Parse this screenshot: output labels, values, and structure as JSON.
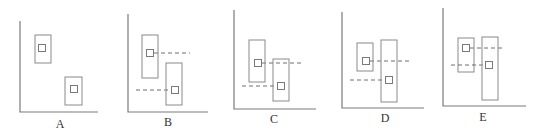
{
  "figure": {
    "colors": {
      "axis": "#7a7a7a",
      "box": "#8a8a8a",
      "dash": "#6e6e6e",
      "label": "#333333"
    },
    "panels": [
      {
        "label": "A",
        "axis": {
          "x": 20,
          "top": 21,
          "bottom": 112,
          "right": 98
        },
        "label_pos": {
          "x": 60,
          "y": 128
        },
        "boxes": [
          {
            "x": 35,
            "y": 35,
            "w": 16,
            "h": 28,
            "mx": 42,
            "my": 48,
            "dash": null
          },
          {
            "x": 65,
            "y": 77,
            "w": 17,
            "h": 28,
            "mx": 74,
            "my": 89,
            "dash": null
          }
        ]
      },
      {
        "label": "B",
        "axis": {
          "x": 128,
          "top": 14,
          "bottom": 112,
          "right": 208
        },
        "label_pos": {
          "x": 168,
          "y": 126
        },
        "boxes": [
          {
            "x": 142,
            "y": 35,
            "w": 16,
            "h": 43,
            "mx": 150,
            "my": 53,
            "dash": {
              "from": 154,
              "to": 190
            }
          },
          {
            "x": 166,
            "y": 63,
            "w": 16,
            "h": 42,
            "mx": 175,
            "my": 90,
            "dash": {
              "from": 136,
              "to": 171
            }
          }
        ]
      },
      {
        "label": "C",
        "axis": {
          "x": 234,
          "top": 10,
          "bottom": 109,
          "right": 316
        },
        "label_pos": {
          "x": 274,
          "y": 123
        },
        "boxes": [
          {
            "x": 249,
            "y": 40,
            "w": 16,
            "h": 42,
            "mx": 258,
            "my": 63,
            "dash": {
              "from": 262,
              "to": 302
            }
          },
          {
            "x": 273,
            "y": 59,
            "w": 16,
            "h": 42,
            "mx": 281,
            "my": 86,
            "dash": {
              "from": 242,
              "to": 277
            }
          }
        ]
      },
      {
        "label": "D",
        "axis": {
          "x": 342,
          "top": 12,
          "bottom": 108,
          "right": 424
        },
        "label_pos": {
          "x": 385,
          "y": 122
        },
        "boxes": [
          {
            "x": 357,
            "y": 43,
            "w": 16,
            "h": 28,
            "mx": 366,
            "my": 61,
            "dash": {
              "from": 370,
              "to": 410
            }
          },
          {
            "x": 381,
            "y": 40,
            "w": 16,
            "h": 62,
            "mx": 389,
            "my": 80,
            "dash": {
              "from": 350,
              "to": 385
            }
          }
        ]
      },
      {
        "label": "E",
        "axis": {
          "x": 443,
          "top": 8,
          "bottom": 106,
          "right": 526
        },
        "label_pos": {
          "x": 483,
          "y": 121
        },
        "boxes": [
          {
            "x": 458,
            "y": 38,
            "w": 16,
            "h": 34,
            "mx": 466,
            "my": 48,
            "dash": {
              "from": 470,
              "to": 505
            }
          },
          {
            "x": 482,
            "y": 37,
            "w": 16,
            "h": 63,
            "mx": 489,
            "my": 65,
            "dash": {
              "from": 451,
              "to": 485
            }
          }
        ]
      }
    ]
  }
}
